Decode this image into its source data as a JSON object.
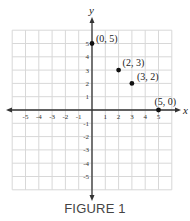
{
  "chart_data": {
    "type": "scatter",
    "title": "",
    "caption": "FIGURE 1",
    "xlabel": "x",
    "ylabel": "y",
    "xlim": [
      -6,
      6
    ],
    "ylim": [
      -6,
      6
    ],
    "grid": true,
    "x_ticks": [
      -5,
      -4,
      -3,
      -2,
      -1,
      1,
      2,
      3,
      4,
      5
    ],
    "y_ticks": [
      5,
      4,
      3,
      2,
      1,
      -1,
      -2,
      -3,
      -4,
      -5
    ],
    "points": [
      {
        "x": 0,
        "y": 5,
        "label": "(0, 5)"
      },
      {
        "x": 2,
        "y": 3,
        "label": "(2, 3)"
      },
      {
        "x": 3,
        "y": 2,
        "label": "(3, 2)"
      },
      {
        "x": 5,
        "y": 0,
        "label": "(5, 0)"
      }
    ],
    "colors": {
      "point": "#111111",
      "axis": "#333333",
      "grid": "#d8d8d8"
    }
  }
}
